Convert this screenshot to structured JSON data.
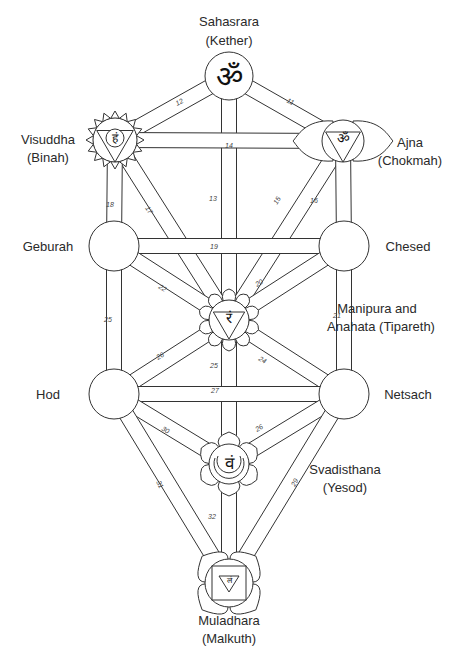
{
  "diagram": {
    "type": "tree-of-life-chakras",
    "line_color": "#333333",
    "background": "#ffffff",
    "nodes": [
      {
        "id": "kether",
        "chakra": "Sahasrara",
        "sephirah": "Kether",
        "label_line1": "Sahasrara",
        "label_line2": "(Kether)",
        "glyph": "ॐ",
        "x": 229,
        "y": 76,
        "r": 24
      },
      {
        "id": "binah",
        "chakra": "Visuddha",
        "sephirah": "Binah",
        "label_line1": "Visuddha",
        "label_line2": "(Binah)",
        "glyph": "हं",
        "x": 115,
        "y": 140,
        "r": 22
      },
      {
        "id": "chokmah",
        "chakra": "Ajna",
        "sephirah": "Chokmah",
        "label_line1": "Ajna",
        "label_line2": "(Chokmah)",
        "glyph": "ॐ",
        "x": 343,
        "y": 141,
        "r": 21
      },
      {
        "id": "geburah",
        "sephirah": "Geburah",
        "label_line1": "Geburah",
        "x": 114,
        "y": 246,
        "r": 25
      },
      {
        "id": "chesed",
        "sephirah": "Chesed",
        "label_line1": "Chesed",
        "x": 344,
        "y": 246,
        "r": 25
      },
      {
        "id": "tiphareth",
        "chakra": "Manipura and Anahata",
        "sephirah": "Tipareth",
        "label_line1": "Manipura and",
        "label_line2": "Anahata (Tipareth)",
        "glyph": "रं",
        "x": 229,
        "y": 320,
        "r": 18
      },
      {
        "id": "hod",
        "sephirah": "Hod",
        "label_line1": "Hod",
        "x": 114,
        "y": 394,
        "r": 25
      },
      {
        "id": "netsach",
        "sephirah": "Netsach",
        "label_line1": "Netsach",
        "x": 344,
        "y": 394,
        "r": 25
      },
      {
        "id": "yesod",
        "chakra": "Svadisthana",
        "sephirah": "Yesod",
        "label_line1": "Svadisthana",
        "label_line2": "(Yesod)",
        "glyph": "वं",
        "x": 229,
        "y": 464,
        "r": 18
      },
      {
        "id": "malkuth",
        "chakra": "Muladhara",
        "sephirah": "Malkuth",
        "label_line1": "Muladhara",
        "label_line2": "(Malkuth)",
        "glyph": "लं",
        "x": 229,
        "y": 583,
        "r": 22
      }
    ],
    "labels": {
      "kether": {
        "l1": "Sahasrara",
        "l2": "(Kether)"
      },
      "binah": {
        "l1": "Visuddha",
        "l2": "(Binah)"
      },
      "chokmah": {
        "l1": "Ajna",
        "l2": "(Chokmah)"
      },
      "geburah": {
        "l1": "Geburah"
      },
      "chesed": {
        "l1": "Chesed"
      },
      "tiphareth": {
        "l1": "Manipura and",
        "l2": "Anahata (Tipareth)"
      },
      "hod": {
        "l1": "Hod"
      },
      "netsach": {
        "l1": "Netsach"
      },
      "yesod": {
        "l1": "Svadisthana",
        "l2": "(Yesod)"
      },
      "malkuth": {
        "l1": "Muladhara",
        "l2": "(Malkuth)"
      }
    },
    "glyphs": {
      "kether": "ॐ",
      "binah": "हं",
      "chokmah": "ॐ",
      "tiphareth": "रं",
      "yesod": "वं",
      "malkuth": "लं"
    },
    "paths": [
      {
        "num": "11",
        "from": "kether",
        "to": "chokmah"
      },
      {
        "num": "12",
        "from": "kether",
        "to": "binah"
      },
      {
        "num": "13",
        "from": "kether",
        "to": "tiphareth"
      },
      {
        "num": "14",
        "from": "binah",
        "to": "chokmah"
      },
      {
        "num": "15",
        "from": "chokmah",
        "to": "tiphareth"
      },
      {
        "num": "16",
        "from": "chokmah",
        "to": "chesed"
      },
      {
        "num": "17",
        "from": "binah",
        "to": "tiphareth"
      },
      {
        "num": "18",
        "from": "binah",
        "to": "geburah"
      },
      {
        "num": "19",
        "from": "geburah",
        "to": "chesed"
      },
      {
        "num": "20",
        "from": "chesed",
        "to": "tiphareth"
      },
      {
        "num": "21",
        "from": "chesed",
        "to": "netsach"
      },
      {
        "num": "22",
        "from": "geburah",
        "to": "tiphareth"
      },
      {
        "num": "24",
        "from": "tiphareth",
        "to": "netsach"
      },
      {
        "num": "25",
        "from": "geburah",
        "to": "hod"
      },
      {
        "num": "26",
        "from": "tiphareth",
        "to": "hod"
      },
      {
        "num": "25",
        "from": "tiphareth",
        "to": "yesod"
      },
      {
        "num": "27",
        "from": "hod",
        "to": "netsach"
      },
      {
        "num": "28",
        "from": "netsach",
        "to": "yesod"
      },
      {
        "num": "29",
        "from": "netsach",
        "to": "malkuth"
      },
      {
        "num": "30",
        "from": "hod",
        "to": "yesod"
      },
      {
        "num": "31",
        "from": "hod",
        "to": "malkuth"
      },
      {
        "num": "32",
        "from": "yesod",
        "to": "malkuth"
      }
    ],
    "path_numbers": {
      "p11": "11",
      "p12": "12",
      "p13": "13",
      "p14": "14",
      "p15": "15",
      "p16": "16",
      "p17": "17",
      "p18": "18",
      "p19": "19",
      "p20": "20",
      "p21": "21",
      "p22": "22",
      "p24": "24",
      "p25a": "25",
      "p26": "26",
      "p25b": "25",
      "p27": "27",
      "p28": "26",
      "p29": "29",
      "p30": "30",
      "p31": "31",
      "p32": "32"
    }
  }
}
